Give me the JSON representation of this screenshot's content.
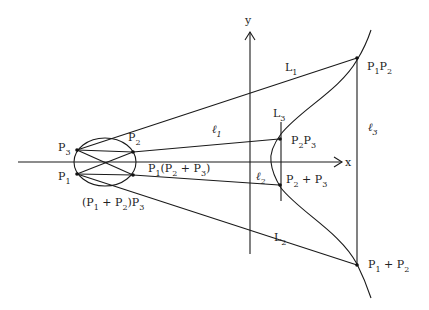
{
  "diagram": {
    "type": "elliptic-curve-group-law",
    "axes": {
      "x_label": "x",
      "y_label": "y"
    },
    "left_points": [
      {
        "name": "P",
        "sub": "3"
      },
      {
        "name": "P",
        "sub": "1"
      },
      {
        "name": "P",
        "sub": "2"
      }
    ],
    "conic_labels": {
      "p1_p2p3": {
        "a": "P",
        "a_sub": "1",
        "open": "(P",
        "b_sub": "2",
        "plus": " + P",
        "c_sub": "3",
        "close": ")"
      },
      "p1p2_p3": {
        "open": "(P",
        "a_sub": "1",
        "plus": " + P",
        "b_sub": "2",
        "close": ")P",
        "c_sub": "3"
      }
    },
    "lines": {
      "L1": {
        "name": "L",
        "sub": "1"
      },
      "L2": {
        "name": "L",
        "sub": "2"
      },
      "L3": {
        "name": "L",
        "sub": "3"
      },
      "l1": {
        "name": "ℓ",
        "sub": "1"
      },
      "l2": {
        "name": "ℓ",
        "sub": "2"
      },
      "l3": {
        "name": "ℓ",
        "sub": "3"
      }
    },
    "curve_points": {
      "p1p2": {
        "a": "P",
        "a_sub": "1",
        "b": "P",
        "b_sub": "2"
      },
      "p1_plus_p2": {
        "a": "P",
        "a_sub": "1",
        "plus": " + P",
        "b_sub": "2"
      },
      "p2p3": {
        "a": "P",
        "a_sub": "2",
        "b": "P",
        "b_sub": "3"
      },
      "p2_plus_p3": {
        "a": "P",
        "a_sub": "2",
        "plus": " + P",
        "b_sub": "3"
      }
    },
    "colors": {
      "ink": "#1a1a1a",
      "background": "#ffffff"
    }
  }
}
